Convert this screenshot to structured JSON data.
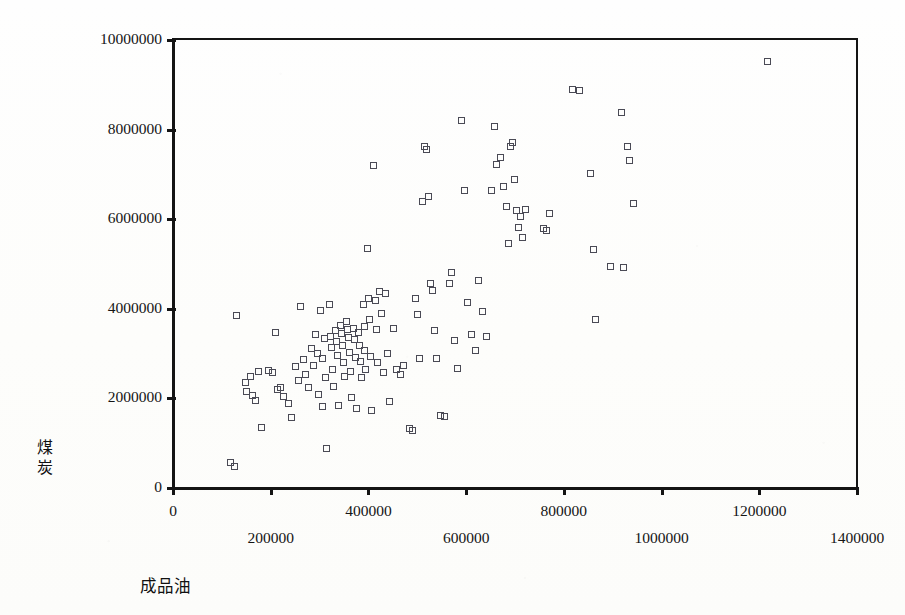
{
  "figure": {
    "y_axis_title": "煤炭",
    "x_axis_title": "成品油"
  },
  "chart_data": {
    "type": "scatter",
    "title": "",
    "xlabel": "成品油",
    "ylabel": "煤炭",
    "xlim": [
      0,
      1400000
    ],
    "ylim": [
      0,
      10000000
    ],
    "xticks": [
      0,
      200000,
      400000,
      600000,
      800000,
      1000000,
      1200000,
      1400000
    ],
    "yticks": [
      0,
      2000000,
      4000000,
      6000000,
      8000000,
      10000000
    ],
    "xtick_labels": [
      "0",
      "200000",
      "400000",
      "600000",
      "800000",
      "1000000",
      "1200000",
      "1400000"
    ],
    "ytick_labels": [
      "0",
      "2000000",
      "4000000",
      "6000000",
      "8000000",
      "10000000"
    ],
    "xtick_label_stagger": true,
    "grid": false,
    "legend": false,
    "marker": "open-square",
    "marker_color": "#4a4a55",
    "series": [
      {
        "name": "煤炭 vs 成品油",
        "points": [
          [
            130000,
            3850000
          ],
          [
            118000,
            560000
          ],
          [
            126000,
            470000
          ],
          [
            150000,
            2350000
          ],
          [
            152000,
            2150000
          ],
          [
            160000,
            2480000
          ],
          [
            163000,
            2050000
          ],
          [
            170000,
            1950000
          ],
          [
            176000,
            2600000
          ],
          [
            182000,
            1350000
          ],
          [
            196000,
            2620000
          ],
          [
            204000,
            2560000
          ],
          [
            210000,
            3450000
          ],
          [
            214000,
            2180000
          ],
          [
            222000,
            2240000
          ],
          [
            228000,
            2040000
          ],
          [
            238000,
            1880000
          ],
          [
            243000,
            1560000
          ],
          [
            252000,
            2700000
          ],
          [
            258000,
            2380000
          ],
          [
            262000,
            4050000
          ],
          [
            268000,
            2860000
          ],
          [
            272000,
            2520000
          ],
          [
            278000,
            2230000
          ],
          [
            284000,
            3100000
          ],
          [
            288000,
            2720000
          ],
          [
            292000,
            3420000
          ],
          [
            296000,
            2990000
          ],
          [
            298000,
            2080000
          ],
          [
            302000,
            3960000
          ],
          [
            306000,
            2880000
          ],
          [
            308000,
            1800000
          ],
          [
            312000,
            3320000
          ],
          [
            314000,
            2460000
          ],
          [
            316000,
            880000
          ],
          [
            322000,
            4080000
          ],
          [
            324000,
            3380000
          ],
          [
            326000,
            3120000
          ],
          [
            328000,
            2640000
          ],
          [
            330000,
            2260000
          ],
          [
            334000,
            3500000
          ],
          [
            336000,
            3250000
          ],
          [
            338000,
            2940000
          ],
          [
            340000,
            1840000
          ],
          [
            344000,
            3620000
          ],
          [
            346000,
            3440000
          ],
          [
            348000,
            3160000
          ],
          [
            350000,
            2780000
          ],
          [
            352000,
            2480000
          ],
          [
            356000,
            3700000
          ],
          [
            358000,
            3520000
          ],
          [
            360000,
            3340000
          ],
          [
            362000,
            3020000
          ],
          [
            364000,
            2600000
          ],
          [
            366000,
            2020000
          ],
          [
            370000,
            3560000
          ],
          [
            372000,
            3300000
          ],
          [
            374000,
            2900000
          ],
          [
            376000,
            1760000
          ],
          [
            380000,
            3460000
          ],
          [
            382000,
            3180000
          ],
          [
            384000,
            2820000
          ],
          [
            386000,
            2460000
          ],
          [
            390000,
            4080000
          ],
          [
            392000,
            3600000
          ],
          [
            394000,
            3060000
          ],
          [
            396000,
            2640000
          ],
          [
            400000,
            5340000
          ],
          [
            402000,
            4220000
          ],
          [
            404000,
            3760000
          ],
          [
            406000,
            2920000
          ],
          [
            408000,
            1720000
          ],
          [
            412000,
            7180000
          ],
          [
            416000,
            4180000
          ],
          [
            418000,
            3520000
          ],
          [
            420000,
            2780000
          ],
          [
            424000,
            4380000
          ],
          [
            428000,
            3880000
          ],
          [
            432000,
            2560000
          ],
          [
            436000,
            4340000
          ],
          [
            440000,
            2980000
          ],
          [
            444000,
            1920000
          ],
          [
            452000,
            3560000
          ],
          [
            458000,
            2640000
          ],
          [
            466000,
            2520000
          ],
          [
            472000,
            2720000
          ],
          [
            486000,
            1320000
          ],
          [
            492000,
            1280000
          ],
          [
            498000,
            4220000
          ],
          [
            502000,
            3860000
          ],
          [
            506000,
            2880000
          ],
          [
            512000,
            6380000
          ],
          [
            516000,
            7620000
          ],
          [
            520000,
            7540000
          ],
          [
            524000,
            6500000
          ],
          [
            528000,
            4560000
          ],
          [
            532000,
            4400000
          ],
          [
            536000,
            3500000
          ],
          [
            540000,
            2880000
          ],
          [
            548000,
            1600000
          ],
          [
            556000,
            1580000
          ],
          [
            566000,
            4560000
          ],
          [
            572000,
            4800000
          ],
          [
            578000,
            3280000
          ],
          [
            584000,
            2660000
          ],
          [
            592000,
            8200000
          ],
          [
            598000,
            6620000
          ],
          [
            604000,
            4120000
          ],
          [
            612000,
            3420000
          ],
          [
            620000,
            3060000
          ],
          [
            626000,
            4620000
          ],
          [
            634000,
            3920000
          ],
          [
            642000,
            3360000
          ],
          [
            652000,
            6640000
          ],
          [
            660000,
            8060000
          ],
          [
            664000,
            7200000
          ],
          [
            672000,
            7360000
          ],
          [
            678000,
            6720000
          ],
          [
            684000,
            6280000
          ],
          [
            688000,
            5440000
          ],
          [
            692000,
            7620000
          ],
          [
            696000,
            7700000
          ],
          [
            700000,
            6880000
          ],
          [
            704000,
            6180000
          ],
          [
            708000,
            5800000
          ],
          [
            712000,
            6040000
          ],
          [
            716000,
            5580000
          ],
          [
            722000,
            6200000
          ],
          [
            760000,
            5780000
          ],
          [
            766000,
            5740000
          ],
          [
            772000,
            6120000
          ],
          [
            818000,
            8880000
          ],
          [
            834000,
            8860000
          ],
          [
            856000,
            7020000
          ],
          [
            862000,
            5320000
          ],
          [
            866000,
            3760000
          ],
          [
            896000,
            4940000
          ],
          [
            918000,
            8380000
          ],
          [
            924000,
            4920000
          ],
          [
            932000,
            7620000
          ],
          [
            936000,
            7300000
          ],
          [
            944000,
            6340000
          ],
          [
            1218000,
            9500000
          ]
        ]
      }
    ]
  }
}
